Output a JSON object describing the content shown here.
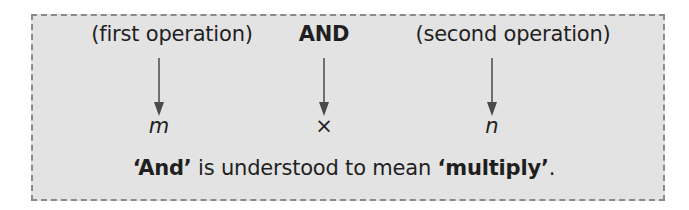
{
  "diagram": {
    "columns": [
      {
        "label": "(first operation)",
        "bold": false,
        "symbol": "m",
        "symbol_italic": true,
        "x": 158
      },
      {
        "label": "AND",
        "bold": true,
        "symbol": "×",
        "symbol_italic": false,
        "x": 324
      },
      {
        "label": "(second operation)",
        "bold": false,
        "symbol": "n",
        "symbol_italic": true,
        "x": 492
      }
    ],
    "summary": {
      "part1_bold": "‘And’",
      "part2": " is understood to mean ",
      "part3_bold": "‘multiply’",
      "part4": "."
    },
    "colors": {
      "box_background": "#e3e3e3",
      "box_border": "#8a8a8a",
      "text": "#1f1f1f",
      "arrow": "#4a4a4a"
    }
  }
}
